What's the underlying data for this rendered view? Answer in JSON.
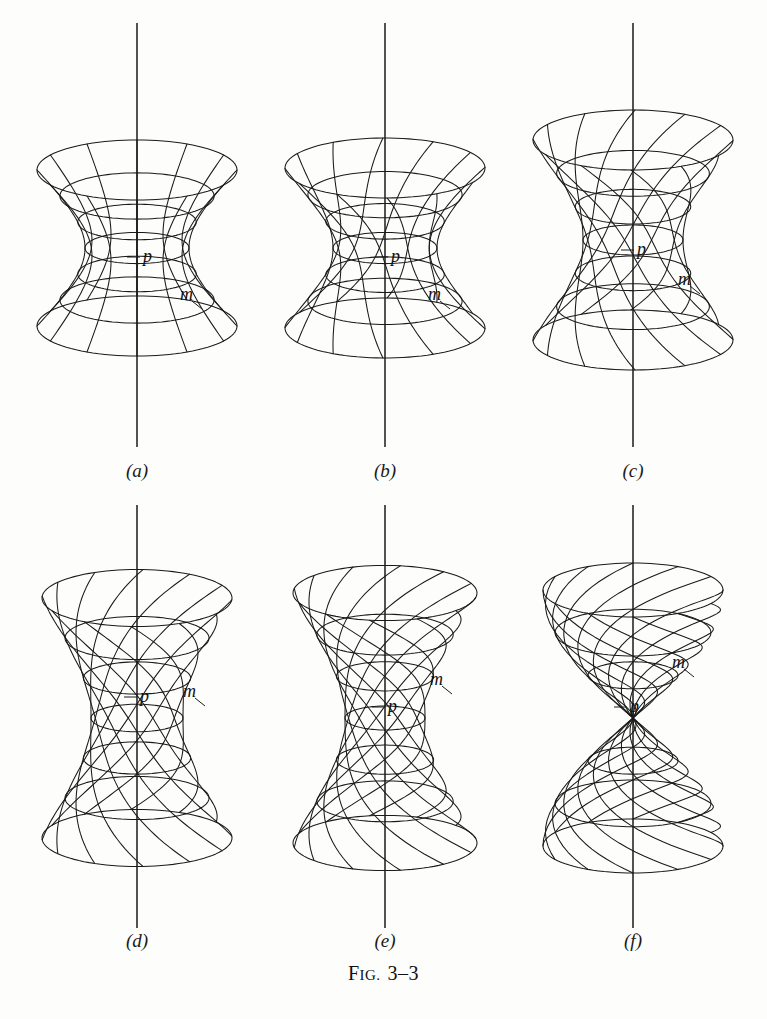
{
  "figure": {
    "caption_prefix": "F",
    "caption_smallcaps": "IG.",
    "caption_number": "3–3",
    "caption_full": "FIG. 3–3",
    "background_color": "#fdfdfb",
    "ink_color": "#1a1a1a",
    "width": 767,
    "height": 1019
  },
  "labels": {
    "point_p": "p",
    "meridian_m": "m"
  },
  "panels": [
    {
      "id": "a",
      "label": "(a)",
      "label_x": 137,
      "label_y": 477,
      "axis_x": 137,
      "axis_top": 23,
      "axis_bottom": 447,
      "center_x": 137,
      "center_y": 248,
      "twist_turns": 0.0,
      "radius_waist": 52,
      "radius_end": 100,
      "half_height": 78,
      "ellipse_k": 0.3,
      "n_rulings": 12,
      "n_circles": 7,
      "p_label_x": 143,
      "p_label_y": 262,
      "m_label_x": 180,
      "m_label_y": 300,
      "description": "hyperboloid of one sheet, untwisted"
    },
    {
      "id": "b",
      "label": "(b)",
      "label_x": 385,
      "label_y": 477,
      "axis_x": 385,
      "axis_top": 23,
      "axis_bottom": 447,
      "center_x": 385,
      "center_y": 248,
      "twist_turns": 0.16,
      "radius_waist": 52,
      "radius_end": 100,
      "half_height": 80,
      "ellipse_k": 0.3,
      "n_rulings": 12,
      "n_circles": 7,
      "p_label_x": 391,
      "p_label_y": 262,
      "m_label_x": 428,
      "m_label_y": 300,
      "description": "slightly twisted hyperboloid"
    },
    {
      "id": "c",
      "label": "(c)",
      "label_x": 633,
      "label_y": 477,
      "axis_x": 633,
      "axis_top": 23,
      "axis_bottom": 447,
      "center_x": 633,
      "center_y": 240,
      "twist_turns": 0.34,
      "radius_waist": 50,
      "radius_end": 100,
      "half_height": 100,
      "ellipse_k": 0.3,
      "n_rulings": 12,
      "n_circles": 7,
      "p_label_x": 637,
      "p_label_y": 255,
      "m_label_x": 678,
      "m_label_y": 285,
      "description": "moderately twisted hyperboloid"
    },
    {
      "id": "d",
      "label": "(d)",
      "label_x": 137,
      "label_y": 947,
      "axis_x": 137,
      "axis_top": 505,
      "axis_bottom": 928,
      "center_x": 137,
      "center_y": 718,
      "twist_turns": 0.52,
      "radius_waist": 46,
      "radius_end": 95,
      "half_height": 120,
      "ellipse_k": 0.3,
      "n_rulings": 12,
      "n_circles": 7,
      "p_label_x": 140,
      "p_label_y": 702,
      "m_label_x": 183,
      "m_label_y": 697,
      "description": "strongly twisted hyperboloid"
    },
    {
      "id": "e",
      "label": "(e)",
      "label_x": 385,
      "label_y": 947,
      "axis_x": 385,
      "axis_top": 505,
      "axis_bottom": 928,
      "center_x": 385,
      "center_y": 718,
      "twist_turns": 0.72,
      "radius_waist": 40,
      "radius_end": 92,
      "half_height": 125,
      "ellipse_k": 0.3,
      "n_rulings": 12,
      "n_circles": 7,
      "p_label_x": 388,
      "p_label_y": 712,
      "m_label_x": 430,
      "m_label_y": 685,
      "description": "nearly degenerate twisted hyperboloid"
    },
    {
      "id": "f",
      "label": "(f)",
      "label_x": 633,
      "label_y": 947,
      "axis_x": 633,
      "axis_top": 505,
      "axis_bottom": 928,
      "center_x": 633,
      "center_y": 718,
      "twist_turns": 1.0,
      "radius_waist": 0,
      "radius_end": 90,
      "half_height": 128,
      "ellipse_k": 0.3,
      "n_rulings": 12,
      "n_circles": 7,
      "p_label_x": 630,
      "p_label_y": 712,
      "m_label_x": 672,
      "m_label_y": 668,
      "description": "degenerate case: double cone / pinched spindle"
    }
  ]
}
